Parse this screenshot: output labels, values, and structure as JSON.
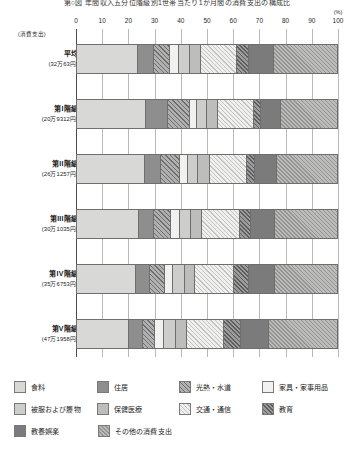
{
  "chart_title": "第○図 年間収入五分位階級別1世帯当たり1か月間の消費支出の構成比",
  "axis": {
    "unit_label": "(%)",
    "expenditure_note": "(消費支出)",
    "ticks": [
      "0",
      "10",
      "20",
      "30",
      "40",
      "50",
      "60",
      "70",
      "80",
      "90",
      "100"
    ]
  },
  "legend": {
    "items": [
      {
        "label": "食料",
        "pattern": "p0"
      },
      {
        "label": "住居",
        "pattern": "p1"
      },
      {
        "label": "光熱・水道",
        "pattern": "p2"
      },
      {
        "label": "家具・家事用品",
        "pattern": "p3"
      },
      {
        "label": "被服および履物",
        "pattern": "p4"
      },
      {
        "label": "保健医療",
        "pattern": "p5"
      },
      {
        "label": "交通・通信",
        "pattern": "p6"
      },
      {
        "label": "教育",
        "pattern": "p7"
      },
      {
        "label": "教養娯楽",
        "pattern": "p8"
      },
      {
        "label": "その他の消費支出",
        "pattern": "p9"
      }
    ]
  },
  "chart_data": {
    "type": "bar",
    "orientation": "horizontal",
    "stacked": true,
    "normalized": true,
    "title": "第○図 年間収入五分位階級別1世帯当たり1か月間の消費支出の構成比",
    "xlabel": "(%)",
    "ylabel": "(消費支出)",
    "xlim": [
      0,
      100
    ],
    "xticks": [
      0,
      10,
      20,
      30,
      40,
      50,
      60,
      70,
      80,
      90,
      100
    ],
    "grid": true,
    "legend_position": "bottom",
    "categories": [
      "平均",
      "第I階級",
      "第II階級",
      "第III階級",
      "第IV階級",
      "第V階級"
    ],
    "category_sublabels": [
      "(32万63円)",
      "(20万9312円)",
      "(26万1257円)",
      "(30万1035円)",
      "(35万6753円)",
      "(47万1958円)"
    ],
    "series": [
      {
        "name": "食料",
        "values": [
          23.3,
          26.5,
          26.0,
          24.0,
          22.5,
          20.0
        ]
      },
      {
        "name": "住居",
        "values": [
          6.3,
          8.5,
          6.5,
          5.8,
          5.5,
          5.2
        ]
      },
      {
        "name": "光熱・水道",
        "values": [
          6.2,
          8.3,
          7.3,
          6.5,
          5.8,
          4.7
        ]
      },
      {
        "name": "家具・家事用品",
        "values": [
          3.3,
          3.0,
          3.0,
          3.3,
          3.3,
          3.5
        ]
      },
      {
        "name": "被服および履物",
        "values": [
          4.3,
          3.7,
          3.8,
          4.2,
          4.3,
          4.8
        ]
      },
      {
        "name": "保健医療",
        "values": [
          4.2,
          4.4,
          4.4,
          4.2,
          4.1,
          4.0
        ]
      },
      {
        "name": "交通・通信",
        "values": [
          14.0,
          13.8,
          14.4,
          14.6,
          15.0,
          14.2
        ]
      },
      {
        "name": "教育",
        "values": [
          4.6,
          2.4,
          3.0,
          4.3,
          5.6,
          6.6
        ]
      },
      {
        "name": "教養娯楽",
        "values": [
          9.6,
          8.0,
          8.4,
          9.2,
          10.0,
          10.8
        ]
      },
      {
        "name": "その他の消費支出",
        "values": [
          24.2,
          21.4,
          23.2,
          23.9,
          23.9,
          26.2
        ]
      }
    ]
  }
}
